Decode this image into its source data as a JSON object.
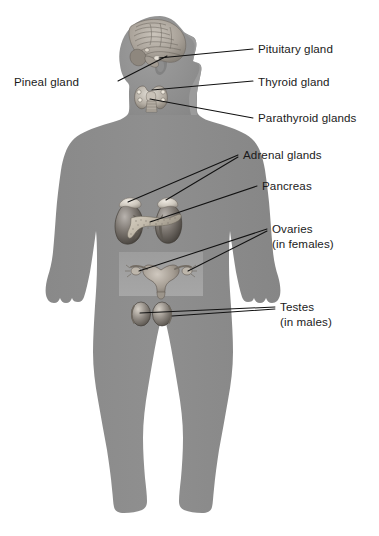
{
  "figure": {
    "body_color": "#8d8d8d",
    "body_edge_color": "#7e7e7e",
    "background_color": "#ffffff",
    "leader_line_color": "#111111",
    "text_color": "#1a1a1a",
    "organ_patch_color": "#9a9a9a"
  },
  "labels": [
    {
      "id": "pineal",
      "name": "Pineal gland",
      "line1": "Pineal gland",
      "line2": "",
      "align": "left",
      "text_x": 14,
      "text_y": 86,
      "leader": "M 118,81 L 167,56"
    },
    {
      "id": "pituitary",
      "name": "Pituitary gland",
      "line1": "Pituitary gland",
      "line2": "",
      "align": "left",
      "text_x": 258,
      "text_y": 53,
      "leader": "M 160,58 L 252,49"
    },
    {
      "id": "thyroid",
      "name": "Thyroid gland",
      "line1": "Thyroid gland",
      "line2": "",
      "align": "left",
      "text_x": 258,
      "text_y": 86,
      "leader": "M 158,92 L 252,81"
    },
    {
      "id": "parathyroid",
      "name": "Parathyroid glands",
      "line1": "Parathyroid glands",
      "line2": "",
      "align": "left",
      "text_x": 258,
      "text_y": 122,
      "leader": "M 155,101 L 252,118"
    },
    {
      "id": "adrenal",
      "name": "Adrenal glands",
      "line1": "Adrenal glands",
      "line2": "",
      "align": "left",
      "text_x": 243,
      "text_y": 159,
      "leader": "M 128,203 L 237,155 M 166,200 L 237,157"
    },
    {
      "id": "pancreas",
      "name": "Pancreas",
      "line1": "Pancreas",
      "line2": "",
      "align": "left",
      "text_x": 262,
      "text_y": 190,
      "leader": "M 150,213 L 256,186"
    },
    {
      "id": "ovaries",
      "name": "Ovaries (in females)",
      "line1": "Ovaries",
      "line2": "(in females)",
      "align": "left",
      "text_x": 272,
      "text_y": 233,
      "leader": "M 141,270 L 266,229 M 192,268 L 266,231"
    },
    {
      "id": "testes",
      "name": "Testes (in males)",
      "line1": "Testes",
      "line2": "(in males)",
      "align": "left",
      "text_x": 280,
      "text_y": 311,
      "leader": "M 139,314 L 274,307 M 173,318 L 274,309"
    }
  ],
  "organs": [
    {
      "id": "brain",
      "name": "brain-sagittal-section"
    },
    {
      "id": "thyroid",
      "name": "thyroid-and-parathyroid-glands"
    },
    {
      "id": "kidneys",
      "name": "kidneys-with-adrenal-glands"
    },
    {
      "id": "pancreas",
      "name": "pancreas"
    },
    {
      "id": "uterus",
      "name": "uterus-with-ovaries"
    },
    {
      "id": "testes",
      "name": "testes"
    }
  ]
}
